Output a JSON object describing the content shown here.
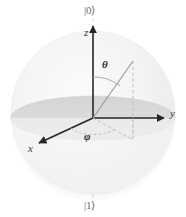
{
  "figure": {
    "type": "bloch-sphere-diagram"
  },
  "labels": {
    "ket_zero": "|0⟩",
    "ket_one": "|1⟩",
    "axis_z": "z",
    "axis_y": "y",
    "axis_x": "x",
    "angle_theta": "θ",
    "angle_phi": "φ"
  },
  "colors": {
    "sphere_fill": "#f2f2f2",
    "equator_fill": "#dcdcdc",
    "axis_stroke": "#262626",
    "vector_stroke": "#8a8a8a",
    "dashed_stroke": "#b4b4b4",
    "text": "#3d3d3d",
    "background": "#ffffff"
  },
  "geometry": {
    "sphere_center_x": 93,
    "sphere_center_y": 113,
    "sphere_radius": 82,
    "origin_x": 93,
    "origin_y": 118,
    "equator_rx": 82,
    "equator_ry": 22,
    "z_axis_tip_x": 93,
    "z_axis_tip_y": 24,
    "y_axis_tip_x": 166,
    "y_axis_tip_y": 118,
    "x_axis_tip_x": 37,
    "x_axis_tip_y": 144,
    "vector_tip_x": 133,
    "vector_tip_y": 61,
    "projection_x": 133,
    "projection_y": 140
  }
}
